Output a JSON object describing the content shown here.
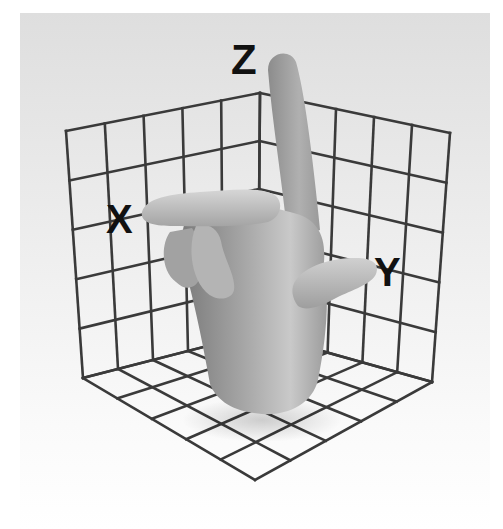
{
  "diagram": {
    "background": {
      "x": 20,
      "y": 13,
      "w": 470,
      "h": 516,
      "top_color": "#e2e2e2",
      "bottom_color": "#ffffff"
    },
    "grid": {
      "color": "#3a3a3a",
      "divisions": 5,
      "points": {
        "left_top": [
          66,
          131
        ],
        "back_top": [
          260,
          93
        ],
        "right_top": [
          450,
          133
        ],
        "left_bottom": [
          83,
          378
        ],
        "back_bottom": [
          258,
          333
        ],
        "right_bottom": [
          432,
          382
        ],
        "front_bottom": [
          255,
          480
        ]
      }
    },
    "axes": [
      {
        "name": "X",
        "label": "X",
        "x": 106,
        "y": 233,
        "size": 40
      },
      {
        "name": "Y",
        "label": "Y",
        "x": 374,
        "y": 286,
        "size": 40
      },
      {
        "name": "Z",
        "label": "Z",
        "x": 231,
        "y": 74,
        "size": 42
      }
    ],
    "hand": {
      "description": "3D gray hand: index finger pointing up (Z), middle finger pointing left (X), thumb pointing right (Y)",
      "color_light": "#c8c8c8",
      "color_mid": "#9a9a9a",
      "color_dark": "#6e6e6e"
    }
  }
}
